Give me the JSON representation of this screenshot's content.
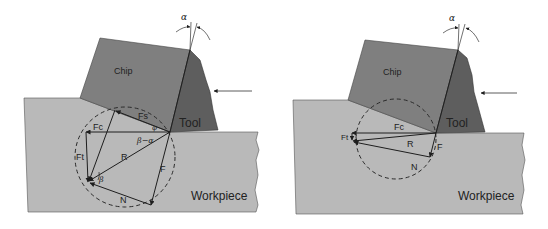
{
  "figure": {
    "panels": [
      {
        "id": "left",
        "labels": {
          "chip": "Chip",
          "tool": "Tool",
          "workpiece": "Workpiece",
          "alpha": "α",
          "Fs": "Fs",
          "Fc": "Fc",
          "Ft": "Ft",
          "R": "R",
          "F": "F",
          "N": "N",
          "phi": "φ",
          "beta_minus_alpha": "β−α",
          "beta": "β"
        }
      },
      {
        "id": "right",
        "labels": {
          "chip": "Chip",
          "tool": "Tool",
          "workpiece": "Workpiece",
          "alpha": "α",
          "Fc": "Fc",
          "Ft": "Ft",
          "R": "R",
          "F": "F",
          "N": "N"
        }
      }
    ],
    "colors": {
      "workpiece": "#b9b9b9",
      "chip": "#7f7f7f",
      "tool": "#5e5e5e",
      "lines": "#1e1e1e",
      "circle": "#2a2a2a"
    }
  }
}
